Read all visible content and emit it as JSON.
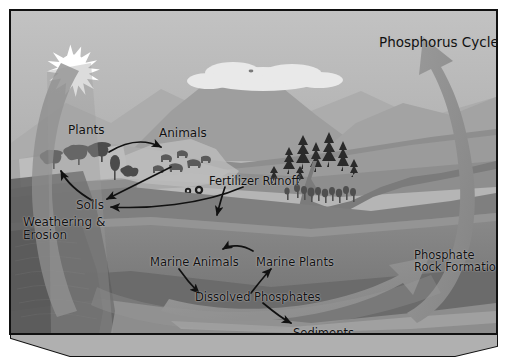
{
  "diagram": {
    "title": "Phosphorus Cycle",
    "kind": "phosphorus-cycle-diagram",
    "labels": {
      "title": "Phosphorus Cycle",
      "plants": "Plants",
      "animals": "Animals",
      "fertilizer_runoff": "Fertilizer Runoff",
      "soils": "Soils",
      "weathering_erosion": "Weathering &\nErosion",
      "marine_animals": "Marine Animals",
      "marine_plants": "Marine Plants",
      "dissolved_phosphates": "Dissolved Phosphates",
      "sediments": "Sediments",
      "phosphate_rock_formation": "Phosphate\nRock Formation"
    },
    "nodes": [
      {
        "id": "plants",
        "label": "Plants"
      },
      {
        "id": "animals",
        "label": "Animals"
      },
      {
        "id": "soils",
        "label": "Soils"
      },
      {
        "id": "weathering-erosion",
        "label": "Weathering & Erosion"
      },
      {
        "id": "fertilizer-runoff",
        "label": "Fertilizer Runoff"
      },
      {
        "id": "marine-animals",
        "label": "Marine Animals"
      },
      {
        "id": "marine-plants",
        "label": "Marine Plants"
      },
      {
        "id": "dissolved-phosphates",
        "label": "Dissolved Phosphates"
      },
      {
        "id": "sediments",
        "label": "Sediments"
      },
      {
        "id": "phosphate-rock-formation",
        "label": "Phosphate Rock Formation"
      }
    ],
    "flows": [
      {
        "from": "plants",
        "to": "animals"
      },
      {
        "from": "animals",
        "to": "soils"
      },
      {
        "from": "plants",
        "to": "soils"
      },
      {
        "from": "soils",
        "to": "plants"
      },
      {
        "from": "fertilizer-runoff",
        "to": "ocean"
      },
      {
        "from": "marine-plants",
        "to": "marine-animals"
      },
      {
        "from": "marine-animals",
        "to": "dissolved-phosphates"
      },
      {
        "from": "dissolved-phosphates",
        "to": "marine-plants"
      },
      {
        "from": "dissolved-phosphates",
        "to": "sediments"
      },
      {
        "from": "sediments",
        "to": "phosphate-rock-formation"
      },
      {
        "from": "phosphate-rock-formation",
        "to": "weathering-erosion"
      }
    ],
    "scenery": [
      {
        "id": "sun",
        "label": "sun"
      },
      {
        "id": "clouds",
        "label": "clouds"
      },
      {
        "id": "mountains",
        "label": "mountains"
      },
      {
        "id": "pine-trees",
        "label": "pine trees"
      },
      {
        "id": "river",
        "label": "river"
      },
      {
        "id": "ocean",
        "label": "ocean"
      },
      {
        "id": "farm-plants",
        "label": "farm plants"
      },
      {
        "id": "grazing-animals",
        "label": "grazing animals"
      }
    ],
    "colors": {
      "sky": "#b9b9b9",
      "cloud": "#ececec",
      "mountain_far": "#a7a7a7",
      "mountain_near": "#999999",
      "land": "#8f8f8f",
      "land_dark": "#737373",
      "ocean": "#828282",
      "ocean_deep": "#6e6e6e",
      "arrow": "#8d8d8d",
      "ink": "#111111",
      "frame": "#111111",
      "sun": "#ffffff"
    }
  }
}
